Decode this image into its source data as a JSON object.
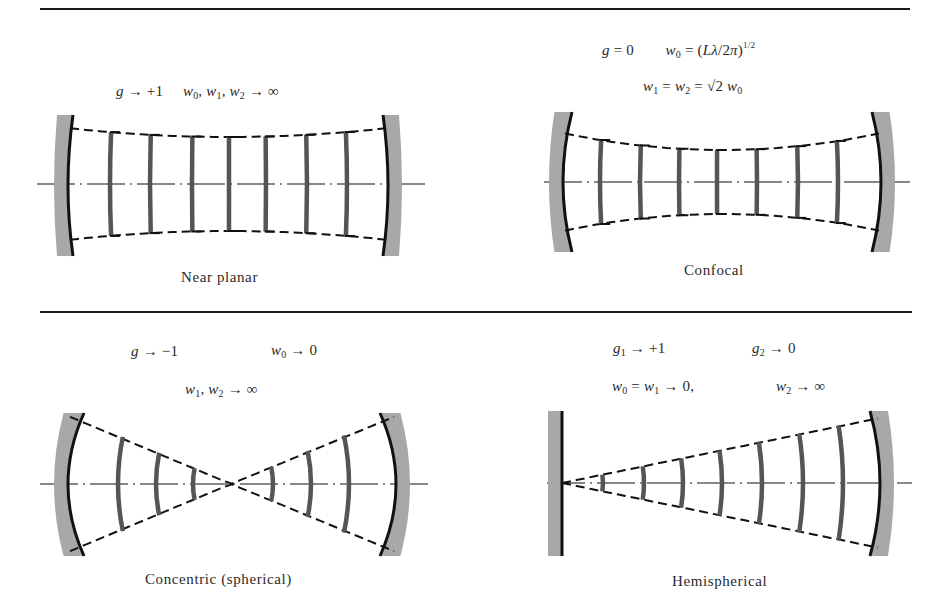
{
  "figure": {
    "colors": {
      "line": "#111111",
      "mirror_fill": "#a8a8a8",
      "wavefront": "#555555",
      "text": "#2a2a2a"
    },
    "panels": [
      {
        "id": "near-planar",
        "caption": "Near planar",
        "equations": [
          {
            "parts": [
              "g",
              " → +1",
              "    ",
              "w",
              "0",
              ", ",
              "w",
              "1",
              ", ",
              "w",
              "2",
              " → ∞"
            ]
          }
        ],
        "equation_text": [
          "g → +1    w₀, w₁, w₂ → ∞"
        ],
        "geometry": {
          "axis_y": 184,
          "axis_x1": 37,
          "axis_x2": 430,
          "left_mirror_x": 68,
          "right_mirror_x": 388,
          "mirror_top": 115,
          "mirror_bottom": 256,
          "left_curvature": 5,
          "right_curvature": -5,
          "beam_left_half": 56,
          "beam_center_half": 47,
          "beam_right_half": 56,
          "beam_shape": "waist",
          "wavefronts_x": [
            110,
            150,
            192,
            229,
            266,
            307,
            347
          ]
        }
      },
      {
        "id": "confocal",
        "caption": "Confocal",
        "equations": [
          {
            "text": "g = 0        w₀ = (Lλ/2π)^1/2"
          },
          {
            "text": "w₁ = w₂ = √2 w₀"
          }
        ],
        "equation_text": [
          "g = 0",
          "w₀ = (Lλ/2π)¹ᐟ²",
          "w₁ = w₂ = √2 w₀"
        ],
        "geometry": {
          "axis_y": 182,
          "axis_x1": 544,
          "axis_x2": 910,
          "left_mirror_x": 563,
          "right_mirror_x": 881,
          "mirror_top": 112,
          "mirror_bottom": 252,
          "left_curvature": 9,
          "right_curvature": -9,
          "beam_left_half": 49,
          "beam_center_half": 32,
          "beam_right_half": 49,
          "beam_shape": "waist",
          "wavefronts_x": [
            600,
            640,
            679,
            717,
            757,
            798,
            838
          ]
        }
      },
      {
        "id": "concentric",
        "caption": "Concentric (spherical)",
        "equations": [
          {
            "text": "g → −1        w₀ → 0"
          },
          {
            "text": "w₁, w₂ → ∞"
          }
        ],
        "equation_text": [
          "g → −1",
          "w₀ → 0",
          "w₁, w₂ → ∞"
        ],
        "geometry": {
          "axis_y": 484,
          "axis_x1": 40,
          "axis_x2": 430,
          "left_mirror_x": 68,
          "right_mirror_x": 396,
          "mirror_top": 413,
          "mirror_bottom": 556,
          "left_curvature": 16,
          "right_curvature": -16,
          "beam_left_half": 68,
          "beam_center_half": 0,
          "beam_right_half": 68,
          "beam_shape": "bowtie",
          "focus_x": 231,
          "wavefronts_x": [
            118,
            156,
            193,
            273,
            311,
            349
          ]
        }
      },
      {
        "id": "hemispherical",
        "caption": "Hemispherical",
        "equations": [
          {
            "text": "g₁ → +1        g₂ → 0"
          },
          {
            "text": "w₀ = w₁ → 0,        w₂ → ∞"
          }
        ],
        "equation_text": [
          "g₁ → +1",
          "g₂ → 0",
          "w₀ = w₁ → 0,",
          "w₂ → ∞"
        ],
        "geometry": {
          "axis_y": 483,
          "axis_x1": 547,
          "axis_x2": 912,
          "left_mirror_x": 562,
          "right_mirror_x": 880,
          "mirror_top": 411,
          "mirror_bottom": 556,
          "left_curvature": 0,
          "right_curvature": -10,
          "beam_left_half": 0,
          "beam_center_half": 0,
          "beam_right_half": 65,
          "beam_shape": "cone",
          "wavefronts_x": [
            603,
            644,
            683,
            722,
            762,
            803,
            843
          ]
        }
      }
    ],
    "rules": [
      {
        "x1": 40,
        "x2": 910,
        "y": 9
      },
      {
        "x1": 40,
        "x2": 912,
        "y": 312
      }
    ]
  },
  "labels": {
    "near_planar": {
      "line1_a": "g",
      "line1_b": " → +1",
      "line1_c": "w",
      "line1_c_sub": "0",
      "line1_d": ", ",
      "line1_e": "w",
      "line1_e_sub": "1",
      "line1_f": ", ",
      "line1_g": "w",
      "line1_g_sub": "2",
      "line1_h": " → ∞",
      "caption": "Near planar"
    },
    "confocal": {
      "line1_a": "g",
      "line1_b": " = 0",
      "line1_c": "w",
      "line1_c_sub": "0",
      "line1_d": " = (",
      "line1_e": "Lλ",
      "line1_f": "/2",
      "line1_g": "π",
      "line1_h": ")",
      "line1_sup": "1/2",
      "line2_a": "w",
      "line2_a_sub": "1",
      "line2_b": " = ",
      "line2_c": "w",
      "line2_c_sub": "2",
      "line2_d": " = √2 ",
      "line2_e": "w",
      "line2_e_sub": "0",
      "caption": "Confocal"
    },
    "concentric": {
      "line1_a": "g",
      "line1_b": " → −1",
      "line1_c": "w",
      "line1_c_sub": "0",
      "line1_d": " → 0",
      "line2_a": "w",
      "line2_a_sub": "1",
      "line2_b": ", ",
      "line2_c": "w",
      "line2_c_sub": "2",
      "line2_d": " → ∞",
      "caption": "Concentric (spherical)"
    },
    "hemispherical": {
      "line1_a": "g",
      "line1_a_sub": "1",
      "line1_b": " → +1",
      "line1_c": "g",
      "line1_c_sub": "2",
      "line1_d": " → 0",
      "line2_a": "w",
      "line2_a_sub": "0",
      "line2_b": " = ",
      "line2_c": "w",
      "line2_c_sub": "1",
      "line2_d": " → 0,",
      "line2_e": "w",
      "line2_e_sub": "2",
      "line2_f": " → ∞",
      "caption": "Hemispherical"
    }
  }
}
